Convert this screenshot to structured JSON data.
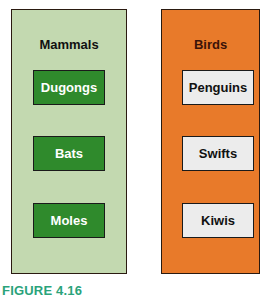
{
  "groups": [
    {
      "title": "Mammals",
      "color": "#c3d9b0",
      "item_color": "#2f8a2c",
      "items": [
        "Dugongs",
        "Bats",
        "Moles"
      ]
    },
    {
      "title": "Birds",
      "color": "#e87a2a",
      "item_color": "#ececec",
      "items": [
        "Penguins",
        "Swifts",
        "Kiwis"
      ]
    }
  ],
  "caption": "FIGURE 4.16"
}
